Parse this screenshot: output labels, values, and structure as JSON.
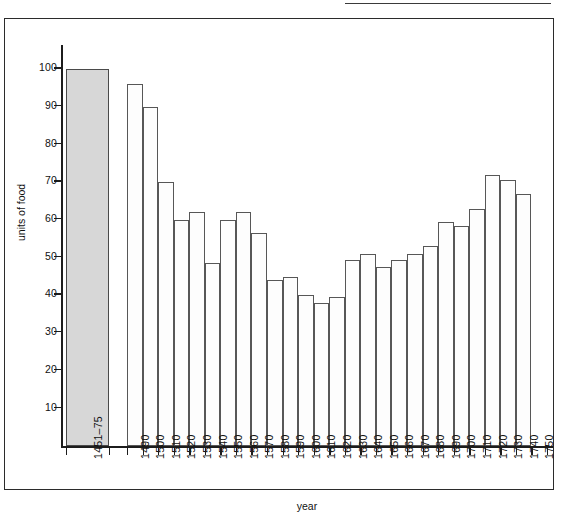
{
  "chart_data": {
    "type": "bar",
    "title": "",
    "xlabel": "year",
    "ylabel": "units of food",
    "ylim": [
      0,
      100
    ],
    "yticks": [
      10,
      20,
      30,
      40,
      50,
      60,
      70,
      80,
      90,
      100
    ],
    "grid": false,
    "legend": null,
    "categories": [
      "1451–75",
      "1490",
      "1500",
      "1510",
      "1520",
      "1530",
      "1540",
      "1550",
      "1560",
      "1570",
      "1580",
      "1590",
      "1600",
      "1610",
      "1620",
      "1630",
      "1640",
      "1650",
      "1660",
      "1670",
      "1680",
      "1690",
      "1700",
      "1710",
      "1720",
      "1730",
      "1740",
      "1750"
    ],
    "values": [
      100,
      96,
      90,
      70,
      60,
      62,
      48.5,
      60,
      62,
      56.5,
      44,
      45,
      40,
      38,
      39.5,
      49.5,
      51,
      47.5,
      49.5,
      51,
      53,
      59.5,
      58.5,
      63,
      72,
      70.5,
      67,
      null
    ],
    "highlight_index": 0,
    "highlight_color": "#d7d7d7",
    "bar_color": "#fdfdfd",
    "bar_edge_color": "#575757"
  },
  "axes": {
    "y_title": "units of food",
    "x_title": "year"
  }
}
